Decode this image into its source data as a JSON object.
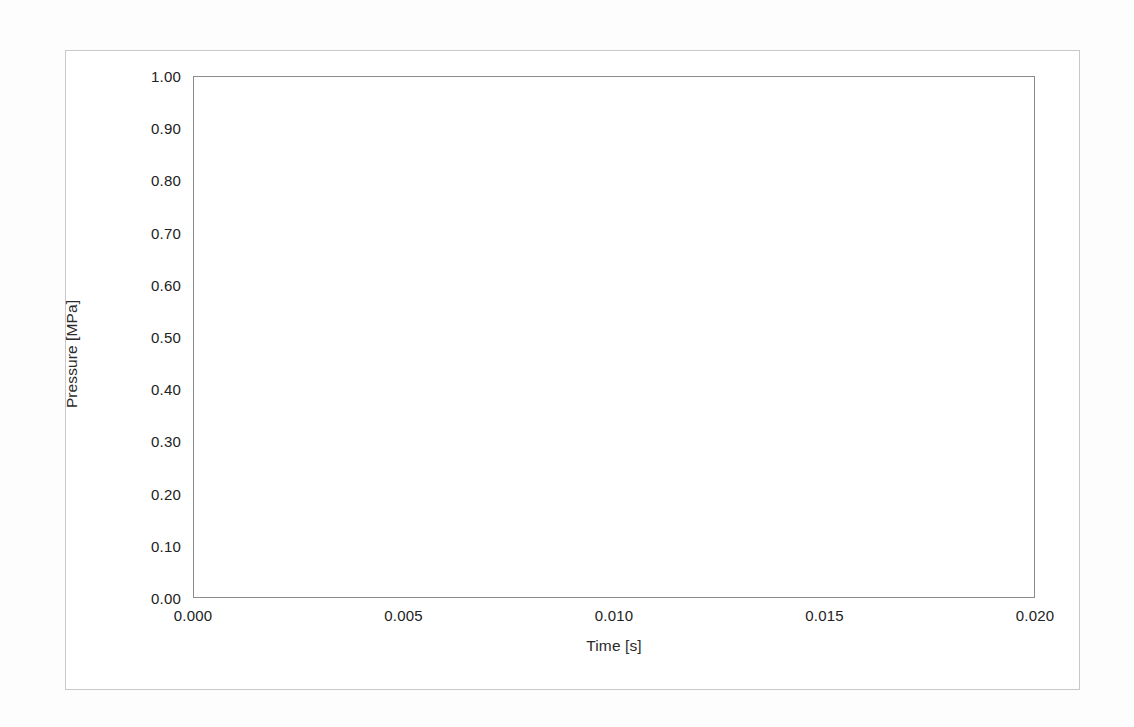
{
  "figure": {
    "background_color": "#ffffff",
    "frame_color": "#c9c9c9"
  },
  "chart_data": {
    "type": "line",
    "title": "",
    "subtitle": "",
    "xlabel": "Time [s]",
    "ylabel": "Pressure [MPa]",
    "xlim": [
      0.0,
      0.02
    ],
    "ylim": [
      0.0,
      1.0
    ],
    "grid": true,
    "legend": null,
    "legend_position": "none",
    "line_color": "#333333",
    "line_width": 3,
    "grid_color": "#cfcfcf",
    "axis_color": "#8c8c8c",
    "xticks": [
      0.0,
      0.005,
      0.01,
      0.015,
      0.02
    ],
    "xtick_labels": [
      "0.000",
      "0.005",
      "0.010",
      "0.015",
      "0.020"
    ],
    "yticks": [
      0.0,
      0.1,
      0.2,
      0.3,
      0.4,
      0.5,
      0.6,
      0.7,
      0.8,
      0.9,
      1.0
    ],
    "ytick_labels": [
      "0.00",
      "0.10",
      "0.20",
      "0.30",
      "0.40",
      "0.50",
      "0.60",
      "0.70",
      "0.80",
      "0.90",
      "1.00"
    ],
    "series": [
      {
        "name": "Pressure pulse",
        "x": [
          0.0,
          0.0005,
          0.001,
          0.0015,
          0.002,
          0.0025,
          0.003,
          0.0035,
          0.004,
          0.0045,
          0.005,
          0.0055,
          0.006,
          0.0065,
          0.007,
          0.0075,
          0.008,
          0.0085,
          0.009,
          0.0095,
          0.01,
          0.011,
          0.012,
          0.013,
          0.014,
          0.015,
          0.016,
          0.017,
          0.018,
          0.019,
          0.02
        ],
        "y": [
          0.0,
          0.156,
          0.309,
          0.454,
          0.588,
          0.707,
          0.809,
          0.891,
          0.951,
          0.988,
          1.0,
          0.988,
          0.951,
          0.891,
          0.809,
          0.707,
          0.588,
          0.454,
          0.309,
          0.156,
          0.0,
          0.0,
          0.0,
          0.0,
          0.0,
          0.0,
          0.0,
          0.0,
          0.0,
          0.0,
          0.0
        ]
      }
    ],
    "peak": {
      "x": 0.005,
      "y": 1.0
    },
    "pulse_end": {
      "x": 0.01,
      "y": 0.0
    }
  }
}
